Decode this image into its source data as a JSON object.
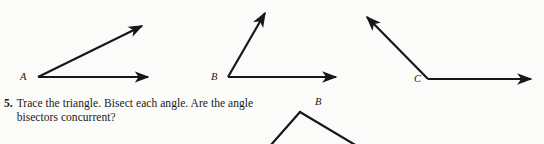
{
  "page": {
    "background_color": "#fbfbf9",
    "ink_color": "#171717",
    "width": 544,
    "height": 144
  },
  "figures": {
    "angle_a": {
      "label": "A",
      "vertex": [
        38,
        77
      ],
      "ray_horizontal_end": [
        152,
        77
      ],
      "ray_upper_end": [
        146,
        24
      ],
      "arrowheads": 2,
      "description": "acute angle opening right and up"
    },
    "angle_b": {
      "label": "B",
      "vertex": [
        228,
        77
      ],
      "ray_horizontal_end": [
        340,
        77
      ],
      "ray_upper_end": [
        268,
        9
      ],
      "arrowheads": 2,
      "description": "acute angle, steeper upper ray"
    },
    "angle_c": {
      "label": "C",
      "vertex": [
        428,
        79
      ],
      "ray_horizontal_end": [
        535,
        79
      ],
      "ray_upper_end": [
        363,
        14
      ],
      "arrowheads": 2,
      "description": "obtuse angle opening up and to the left"
    },
    "triangle_partial": {
      "label": "B",
      "apex": [
        300,
        112
      ],
      "left_end": [
        270,
        144
      ],
      "right_end": [
        356,
        144
      ],
      "description": "partial triangle cropped by bottom page edge"
    }
  },
  "exercise": {
    "number": "5.",
    "text": "Trace the triangle. Bisect each angle. Are the angle bisectors concurrent?"
  }
}
